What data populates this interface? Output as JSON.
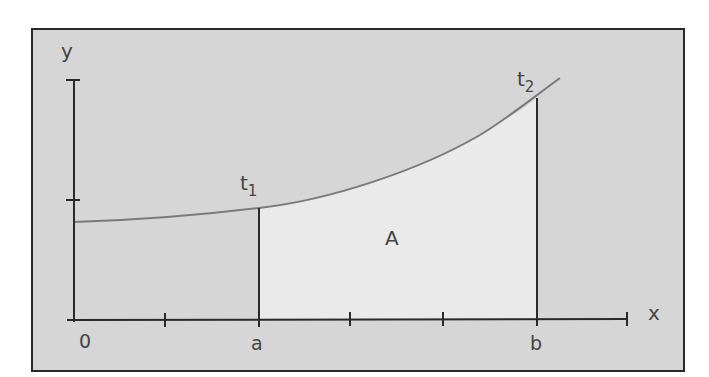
{
  "diagram": {
    "type": "area-under-curve",
    "axes": {
      "x_label": "x",
      "y_label": "y",
      "origin_label": "0",
      "x_ticks": [
        "0",
        "",
        "a",
        "",
        "",
        "b",
        ""
      ],
      "y_ticks": 2
    },
    "bounds": {
      "lower": "a",
      "upper": "b"
    },
    "points": [
      {
        "label": "t",
        "subscript": "1",
        "at": "a"
      },
      {
        "label": "t",
        "subscript": "2",
        "at": "b"
      }
    ],
    "area_label": "A",
    "colors": {
      "background": "#d6d6d6",
      "area_fill": "#eaeaea",
      "curve": "#7a7a7a",
      "axes": "#2a2a2a",
      "frame": "#2a2a2a"
    }
  }
}
